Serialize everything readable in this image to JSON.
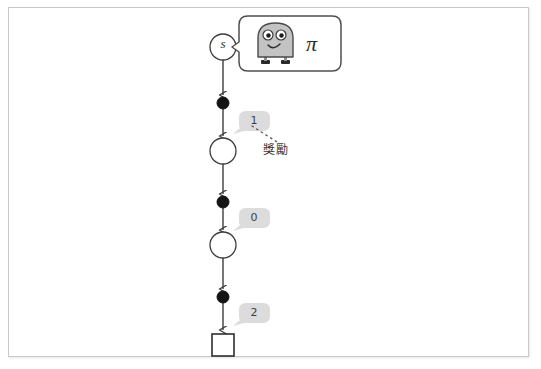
{
  "figure": {
    "title": "",
    "background_color": "#ffffff",
    "frame_color": "#c9c9c9",
    "accent_gray": "#d9d9d9",
    "line_color": "#4a4a4a",
    "node_fill": "#ffffff",
    "dot_fill": "#1a1a1a",
    "robot_body_color": "#c0c0c0"
  },
  "agent": {
    "policy_symbol": "π",
    "robot_name": "robot-agent",
    "bubble_name": "policy-speech-bubble"
  },
  "chain": {
    "start_state_label": "s",
    "nodes": [
      {
        "type": "state",
        "label": "s",
        "cx": 223,
        "cy": 47,
        "r": 13
      },
      {
        "type": "action",
        "label": "",
        "cx": 223,
        "cy": 103,
        "r": 6
      },
      {
        "type": "state",
        "label": "",
        "cx": 223,
        "cy": 151,
        "r": 13
      },
      {
        "type": "action",
        "label": "",
        "cx": 223,
        "cy": 202,
        "r": 6
      },
      {
        "type": "state",
        "label": "",
        "cx": 223,
        "cy": 245,
        "r": 13
      },
      {
        "type": "action",
        "label": "",
        "cx": 223,
        "cy": 297,
        "r": 6
      },
      {
        "type": "terminal",
        "label": "",
        "cx": 223,
        "cy": 345,
        "size": 22
      }
    ]
  },
  "rewards": [
    {
      "value": "1",
      "x": 247,
      "y": 120,
      "name": "reward-badge-1"
    },
    {
      "value": "0",
      "x": 247,
      "y": 217,
      "name": "reward-badge-0"
    },
    {
      "value": "2",
      "x": 247,
      "y": 312,
      "name": "reward-badge-2"
    }
  ],
  "annotation": {
    "label": "獎勵",
    "points_to": "reward-badge-1",
    "x": 263,
    "y": 140
  }
}
